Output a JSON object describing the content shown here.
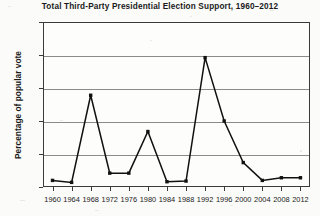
{
  "chart_data": {
    "type": "line",
    "title": "Total Third-Party Presidential Election Support, 1960–2012",
    "xlabel": "",
    "ylabel": "Percentage of popular vote",
    "ylim": [
      0,
      25
    ],
    "yticks": [
      0,
      5,
      10,
      15,
      20,
      25
    ],
    "ytick_labels": [
      "0",
      "5",
      "10",
      "15",
      "20",
      "25"
    ],
    "grid": true,
    "legend": "none",
    "marker": "square",
    "line_color": "#111111",
    "categories": [
      "1960",
      "1964",
      "1968",
      "1972",
      "1976",
      "1980",
      "1984",
      "1988",
      "1992",
      "1996",
      "2000",
      "2004",
      "2008",
      "2012"
    ],
    "values": [
      1.0,
      0.7,
      13.9,
      2.1,
      2.1,
      8.4,
      0.8,
      0.9,
      19.6,
      10.0,
      3.7,
      1.0,
      1.4,
      1.4
    ],
    "x": [
      1960,
      1964,
      1968,
      1972,
      1976,
      1980,
      1984,
      1988,
      1992,
      1996,
      2000,
      2004,
      2008,
      2012
    ],
    "xlim": [
      1958,
      2014
    ]
  },
  "figure": {
    "background_color": "#fbfbf9",
    "plot_background_color": "#fdfdfb",
    "frame_color": "#3a3a3a",
    "gridline_color": "#8b8b8b"
  }
}
